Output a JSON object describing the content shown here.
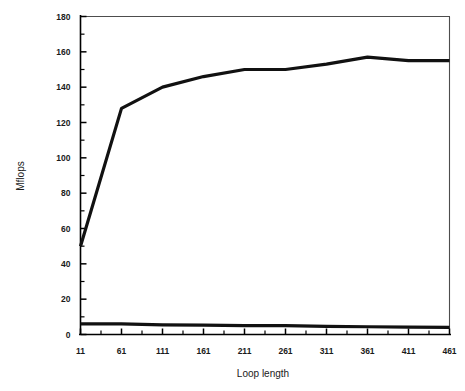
{
  "chart_data": {
    "type": "line",
    "title": "",
    "xlabel": "Loop length",
    "ylabel": "Mflops",
    "xlim": [
      11,
      461
    ],
    "ylim": [
      0,
      180
    ],
    "grid": false,
    "legend": "none",
    "x_tick_labels": [
      "11",
      "61",
      "111",
      "161",
      "211",
      "261",
      "311",
      "361",
      "411",
      "461"
    ],
    "x_tick_values": [
      11,
      61,
      111,
      161,
      211,
      261,
      311,
      361,
      411,
      461
    ],
    "x_minor_step": 25,
    "y_tick_labels": [
      "0",
      "20",
      "40",
      "60",
      "80",
      "100",
      "120",
      "140",
      "160",
      "180"
    ],
    "y_tick_values": [
      0,
      20,
      40,
      60,
      80,
      100,
      120,
      140,
      160,
      180
    ],
    "y_minor_step": 10,
    "x": [
      11,
      61,
      111,
      161,
      211,
      261,
      311,
      361,
      411,
      461
    ],
    "series": [
      {
        "name": "upper-series",
        "color": "#111111",
        "values": [
          50,
          128,
          140,
          146,
          150,
          150,
          153,
          157,
          155,
          155
        ]
      },
      {
        "name": "lower-series",
        "color": "#111111",
        "values": [
          6,
          6,
          5.5,
          5.3,
          5,
          5,
          4.6,
          4.4,
          4.2,
          4
        ]
      }
    ]
  },
  "labels": {
    "y_axis_title": "Mflops",
    "x_axis_title": "Loop length"
  }
}
